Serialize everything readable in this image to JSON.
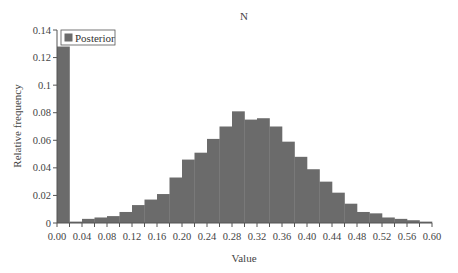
{
  "chart_data": {
    "type": "bar",
    "title": "N",
    "xlabel": "Value",
    "ylabel": "Relative frequency",
    "xlim": [
      0.0,
      0.6
    ],
    "ylim": [
      0,
      0.14
    ],
    "bin_width": 0.02,
    "x_ticks": [
      "0.00",
      "0.04",
      "0.08",
      "0.12",
      "0.16",
      "0.20",
      "0.24",
      "0.28",
      "0.32",
      "0.36",
      "0.40",
      "0.44",
      "0.48",
      "0.52",
      "0.56",
      "0.60"
    ],
    "y_ticks": [
      "0",
      "0.02",
      "0.04",
      "0.06",
      "0.08",
      "0.1",
      "0.12",
      "0.14"
    ],
    "grid": false,
    "legend_position": "top-left",
    "bar_color": "#6b6b6b",
    "categories": [
      "0.00",
      "0.02",
      "0.04",
      "0.06",
      "0.08",
      "0.10",
      "0.12",
      "0.14",
      "0.16",
      "0.18",
      "0.20",
      "0.22",
      "0.24",
      "0.26",
      "0.28",
      "0.30",
      "0.32",
      "0.34",
      "0.36",
      "0.38",
      "0.40",
      "0.42",
      "0.44",
      "0.46",
      "0.48",
      "0.50",
      "0.52",
      "0.54",
      "0.56",
      "0.58"
    ],
    "series": [
      {
        "name": "Posterior",
        "values": [
          0.128,
          0.001,
          0.003,
          0.004,
          0.005,
          0.008,
          0.013,
          0.017,
          0.021,
          0.033,
          0.046,
          0.051,
          0.061,
          0.07,
          0.081,
          0.075,
          0.076,
          0.07,
          0.059,
          0.048,
          0.039,
          0.03,
          0.022,
          0.014,
          0.008,
          0.007,
          0.004,
          0.003,
          0.002,
          0.001
        ]
      }
    ]
  }
}
